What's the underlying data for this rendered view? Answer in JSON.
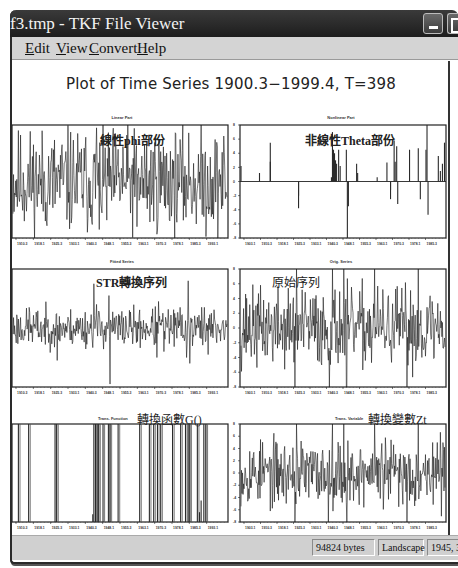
{
  "window": {
    "title": "f3.tmp - TKF File Viewer",
    "buttons": {
      "minimize": "minimize-button",
      "maximize": "maximize-button"
    }
  },
  "menu": [
    {
      "label": "Edit",
      "accel": "E",
      "rest": "dit",
      "x": 13
    },
    {
      "label": "View",
      "accel": "V",
      "rest": "iew",
      "x": 44
    },
    {
      "label": "Convert",
      "accel": "C",
      "rest": "onvert",
      "x": 77
    },
    {
      "label": "Help",
      "accel": "H",
      "rest": "elp",
      "x": 125
    }
  ],
  "main_title": "Plot of Time Series 1900.3−1999.4, T=398",
  "status": {
    "size": "94824 bytes",
    "orientation": "Landscape",
    "dimensions": "1945, 3096"
  },
  "chart_data": [
    {
      "id": "linear",
      "type": "line",
      "title": "Linear Part",
      "annotation": "線性phi部份",
      "x_ticks": [
        "1910.3",
        "1918.1",
        "1925.3",
        "1933.1",
        "1940.3",
        "1948.1",
        "1955.3",
        "1963.1",
        "1970.3",
        "1978.1",
        "1985.3",
        "1993.1"
      ],
      "y_range": [
        -1,
        1
      ],
      "n": 398,
      "style": "noise",
      "amplitude": 0.45,
      "seed": 11,
      "spikes": [
        [
          155,
          0.95
        ],
        [
          160,
          -0.85
        ],
        [
          230,
          -0.8
        ],
        [
          270,
          0.75
        ],
        [
          60,
          -0.7
        ]
      ]
    },
    {
      "id": "nonlinear",
      "type": "bar",
      "title": "Nonlinear Part",
      "annotation": "非線性Theta部份",
      "x_ticks": [
        "1903.1",
        "1910.3",
        "1918.1",
        "1925.3",
        "1933.1",
        "1940.3",
        "1948.1",
        "1955.3",
        "1963.1",
        "1970.3",
        "1978.1",
        "1985.3"
      ],
      "y_ticks": [
        "8",
        "6",
        "4",
        "2",
        "0",
        "-2",
        "-4",
        "-6",
        "-8"
      ],
      "y_range": [
        -8,
        8
      ],
      "n": 398,
      "style": "sparse",
      "spikes": [
        [
          0,
          2.2
        ],
        [
          36,
          1.2
        ],
        [
          57,
          5.5
        ],
        [
          57,
          2.8
        ],
        [
          112,
          -2.0
        ],
        [
          112,
          -3.8
        ],
        [
          176,
          0.6
        ],
        [
          178,
          7.0
        ],
        [
          180,
          4.5
        ],
        [
          182,
          4.0
        ],
        [
          184,
          3.0
        ],
        [
          186,
          2.5
        ],
        [
          190,
          4.5
        ],
        [
          193,
          2.2
        ],
        [
          205,
          4.5
        ],
        [
          207,
          -8.0
        ],
        [
          209,
          -3.5
        ],
        [
          225,
          2.5
        ],
        [
          227,
          1.2
        ],
        [
          265,
          0.6
        ],
        [
          284,
          2.7
        ],
        [
          291,
          -1.2
        ],
        [
          291,
          -2.5
        ],
        [
          298,
          5.8
        ],
        [
          300,
          2.8
        ],
        [
          303,
          5.0
        ],
        [
          305,
          -3.2
        ],
        [
          328,
          4.5
        ],
        [
          345,
          4.7
        ],
        [
          349,
          -2.5
        ],
        [
          360,
          4.5
        ],
        [
          362,
          9.0
        ],
        [
          364,
          -4.7
        ],
        [
          384,
          3.6
        ],
        [
          388,
          1.5
        ],
        [
          392,
          2.5
        ],
        [
          396,
          5.5
        ]
      ]
    },
    {
      "id": "fitted",
      "type": "line",
      "title": "Fitted Series",
      "annotation": "STR轉換序列",
      "x_ticks": [
        "1910.3",
        "1918.1",
        "1925.3",
        "1933.1",
        "1940.3",
        "1948.1",
        "1955.3",
        "1963.1",
        "1970.3",
        "1978.1",
        "1985.3",
        "1993.1"
      ],
      "y_range": [
        -1,
        1
      ],
      "n": 398,
      "style": "noise",
      "amplitude": 0.16,
      "seed": 23,
      "spikes": [
        [
          30,
          0.35
        ],
        [
          82,
          -0.55
        ],
        [
          150,
          0.75
        ],
        [
          155,
          0.4
        ],
        [
          178,
          0.55
        ],
        [
          180,
          -0.95
        ],
        [
          270,
          0.45
        ],
        [
          267,
          -0.5
        ],
        [
          280,
          -0.4
        ],
        [
          310,
          0.35
        ],
        [
          325,
          0.8
        ],
        [
          322,
          -0.5
        ],
        [
          328,
          -0.6
        ],
        [
          355,
          0.35
        ],
        [
          362,
          -0.45
        ]
      ]
    },
    {
      "id": "original",
      "type": "line",
      "title": "Orig. Series",
      "annotation": "原始序列",
      "x_ticks": [
        "1903.1",
        "1910.3",
        "1918.1",
        "1925.3",
        "1933.1",
        "1940.3",
        "1948.1",
        "1955.3",
        "1963.1",
        "1970.3",
        "1978.1",
        "1985.3"
      ],
      "y_ticks": [
        "8",
        "6",
        "4",
        "2",
        "0",
        "-2",
        "-4",
        "-6",
        "-8"
      ],
      "y_range": [
        -8,
        8
      ],
      "n": 398,
      "style": "noise",
      "amplitude": 2.6,
      "seed": 37,
      "spikes": [
        [
          105,
          -5.6
        ],
        [
          108,
          7.0
        ],
        [
          178,
          7.5
        ],
        [
          200,
          7.3
        ],
        [
          206,
          -6.8
        ],
        [
          205,
          -5.0
        ],
        [
          260,
          7.0
        ],
        [
          323,
          -7.0
        ],
        [
          345,
          7.0
        ],
        [
          172,
          -5.0
        ]
      ]
    },
    {
      "id": "trans_function",
      "type": "bar",
      "title": "Trans. Function",
      "annotation": "轉換函數G()",
      "x_ticks": [
        "1910.3",
        "1918.1",
        "1925.3",
        "1933.1",
        "1940.3",
        "1948.1",
        "1955.3",
        "1963.1",
        "1970.3",
        "1978.1",
        "1985.3",
        "1993.1"
      ],
      "y_range": [
        0,
        1
      ],
      "n": 398,
      "style": "indicator",
      "spikes": [
        [
          10,
          1
        ],
        [
          29,
          1
        ],
        [
          78,
          1
        ],
        [
          81,
          1
        ],
        [
          148,
          0.08
        ],
        [
          150,
          1
        ],
        [
          153,
          1
        ],
        [
          156,
          1
        ],
        [
          159,
          1
        ],
        [
          167,
          1
        ],
        [
          177,
          1
        ],
        [
          180,
          1
        ],
        [
          195,
          1
        ],
        [
          235,
          1
        ],
        [
          253,
          1
        ],
        [
          261,
          1
        ],
        [
          268,
          1
        ],
        [
          274,
          1
        ],
        [
          296,
          1
        ],
        [
          311,
          1
        ],
        [
          320,
          1
        ],
        [
          325,
          1
        ],
        [
          328,
          1
        ],
        [
          342,
          1
        ],
        [
          346,
          0.1
        ],
        [
          349,
          0.22
        ],
        [
          354,
          1
        ],
        [
          358,
          1
        ]
      ]
    },
    {
      "id": "trans_variable",
      "type": "line",
      "title": "Trans. Variable",
      "annotation": "轉換變數Zt",
      "x_ticks": [
        "1903.1",
        "1910.3",
        "1918.1",
        "1925.3",
        "1933.1",
        "1940.3",
        "1948.1",
        "1955.3",
        "1963.1",
        "1970.3",
        "1978.1",
        "1985.3"
      ],
      "y_ticks": [
        "8",
        "6",
        "4",
        "2",
        "0",
        "-2",
        "-4",
        "-6",
        "-8"
      ],
      "y_range": [
        -8,
        8
      ],
      "n": 398,
      "style": "noise",
      "amplitude": 2.6,
      "seed": 53,
      "spikes": [
        [
          105,
          -5.2
        ],
        [
          108,
          4.6
        ],
        [
          178,
          6.2
        ],
        [
          200,
          6.0
        ],
        [
          206,
          -6.3
        ],
        [
          260,
          5.0
        ],
        [
          323,
          -6.5
        ],
        [
          345,
          5.5
        ],
        [
          170,
          -4.8
        ]
      ]
    }
  ]
}
